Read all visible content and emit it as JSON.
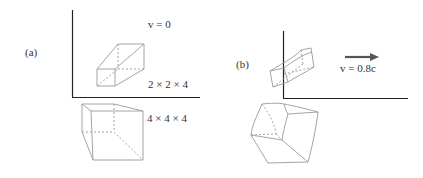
{
  "panels": [
    {
      "id": "a",
      "label": "(a)",
      "velocity_label": "v = 0",
      "box_small_dims": "2 × 2 × 4",
      "box_large_dims": "4 × 4 × 4"
    },
    {
      "id": "b",
      "label": "(b)",
      "velocity_label": "v = 0.8c",
      "arrow": "velocity-arrow-right"
    }
  ],
  "colors": {
    "axis": "#222222",
    "box_edge": "#9a9a9a",
    "arrow": "#555555",
    "text": "#333333"
  }
}
